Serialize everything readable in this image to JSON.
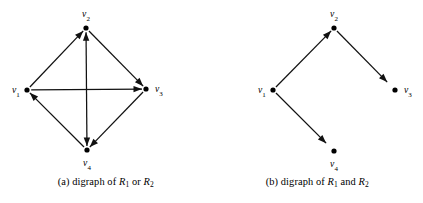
{
  "figure": {
    "panels": [
      {
        "id": "panel-a",
        "caption_prefix": "(a) digraph of ",
        "caption_r1": "R",
        "caption_r1_sub": "1",
        "caption_conjunction": " or ",
        "caption_r2": "R",
        "caption_r2_sub": "2",
        "caption_full": "(a) digraph of R1 or R2",
        "nodes": [
          {
            "id": "v1",
            "label": "v",
            "sub": "1",
            "x": 27,
            "y": 90,
            "label_x": 12,
            "label_y": 93,
            "label_anchor": "start"
          },
          {
            "id": "v2",
            "label": "v",
            "sub": "2",
            "x": 86,
            "y": 28,
            "label_x": 86,
            "label_y": 17,
            "label_anchor": "middle"
          },
          {
            "id": "v3",
            "label": "v",
            "sub": "3",
            "x": 146,
            "y": 89,
            "label_x": 155,
            "label_y": 92,
            "label_anchor": "start"
          },
          {
            "id": "v4",
            "label": "v",
            "sub": "4",
            "x": 87,
            "y": 150,
            "label_x": 87,
            "label_y": 166,
            "label_anchor": "middle"
          }
        ],
        "edges": [
          {
            "from": "v1",
            "to": "v2",
            "kind": "directed"
          },
          {
            "from": "v1",
            "to": "v3",
            "kind": "directed"
          },
          {
            "from": "v2",
            "to": "v3",
            "kind": "directed"
          },
          {
            "from": "v2",
            "to": "v4",
            "kind": "bidirectional"
          },
          {
            "from": "v3",
            "to": "v4",
            "kind": "directed"
          },
          {
            "from": "v4",
            "to": "v1",
            "kind": "directed"
          }
        ]
      },
      {
        "id": "panel-b",
        "caption_prefix": "(b) digraph of ",
        "caption_r1": "R",
        "caption_r1_sub": "1",
        "caption_conjunction": " and ",
        "caption_r2": "R",
        "caption_r2_sub": "2",
        "caption_full": "(b) digraph of R1 and R2",
        "nodes": [
          {
            "id": "v1",
            "label": "v",
            "sub": "1",
            "x": 61,
            "y": 90,
            "label_x": 46,
            "label_y": 93,
            "label_anchor": "start"
          },
          {
            "id": "v2",
            "label": "v",
            "sub": "2",
            "x": 122,
            "y": 28,
            "label_x": 122,
            "label_y": 17,
            "label_anchor": "middle"
          },
          {
            "id": "v3",
            "label": "v",
            "sub": "3",
            "x": 183,
            "y": 90,
            "label_x": 192,
            "label_y": 93,
            "label_anchor": "start"
          },
          {
            "id": "v4",
            "label": "v",
            "sub": "4",
            "x": 122,
            "y": 151,
            "label_x": 122,
            "label_y": 167,
            "label_anchor": "middle"
          }
        ],
        "edges": [
          {
            "from": "v1",
            "to": "v2",
            "kind": "directed"
          },
          {
            "from": "v2",
            "to": "v3",
            "kind": "directed-short"
          },
          {
            "from": "v1",
            "to": "v4",
            "kind": "directed-short"
          }
        ]
      }
    ],
    "style": {
      "ink": "#111111",
      "background": "#ffffff",
      "vertex_radius": 2.6,
      "arrow_length": 8.5,
      "arrow_width": 3.2
    }
  }
}
